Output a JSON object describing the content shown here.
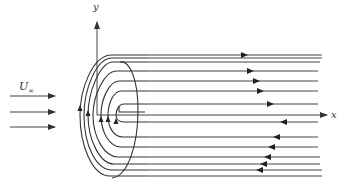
{
  "diagram": {
    "title": "",
    "labels": {
      "y_axis": "y",
      "x_axis": "x",
      "freestream": "U",
      "freestream_sub": "∞"
    },
    "colors": {
      "line": "#444444",
      "background": "#ffffff"
    },
    "freestream_arrows": [
      {
        "y": 96,
        "x1": 10,
        "x2": 55
      },
      {
        "y": 112,
        "x1": 10,
        "x2": 55
      },
      {
        "y": 127,
        "x1": 10,
        "x2": 55
      }
    ],
    "upper_streamlines": [
      {
        "y": 55,
        "arrow_x": 246,
        "dir": "right"
      },
      {
        "y": 58,
        "arrow_x": null,
        "dir": "right"
      },
      {
        "y": 62,
        "arrow_x": null,
        "dir": "right"
      },
      {
        "y": 71,
        "arrow_x": 252,
        "dir": "right"
      },
      {
        "y": 81,
        "arrow_x": 258,
        "dir": "right"
      },
      {
        "y": 91,
        "arrow_x": 262,
        "dir": "right"
      },
      {
        "y": 104,
        "arrow_x": 272,
        "dir": "right"
      }
    ],
    "lower_streamlines": [
      {
        "y": 122,
        "arrow_x": 282,
        "dir": "left"
      },
      {
        "y": 137,
        "arrow_x": 275,
        "dir": "left"
      },
      {
        "y": 147,
        "arrow_x": 270,
        "dir": "left"
      },
      {
        "y": 157,
        "arrow_x": 266,
        "dir": "left"
      },
      {
        "y": 164,
        "arrow_x": 262,
        "dir": "left"
      },
      {
        "y": 170,
        "arrow_x": 258,
        "dir": "left"
      },
      {
        "y": 176,
        "arrow_x": null,
        "dir": "left"
      }
    ],
    "axes": {
      "origin": {
        "x": 97,
        "y": 115
      },
      "x_end": 327,
      "y_end": 20
    }
  }
}
